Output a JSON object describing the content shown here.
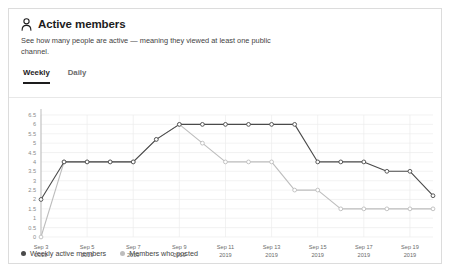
{
  "panel": {
    "icon": "person-icon",
    "title": "Active members",
    "description": "See how many people are active — meaning they viewed at least one public channel.",
    "tabs": [
      {
        "label": "Weekly",
        "active": true
      },
      {
        "label": "Daily",
        "active": false
      }
    ]
  },
  "colors": {
    "series_weekly_active": "#4a4a4a",
    "series_members_posted": "#bdbdbd",
    "grid": "#ededed",
    "axis_text": "#8a8a8a",
    "panel_border": "#dcdcdc",
    "tab_active": "#1d1c1d"
  },
  "chart_data": {
    "type": "line",
    "title": "",
    "xlabel": "",
    "ylabel": "",
    "ylim": [
      0,
      6.5
    ],
    "yticks": [
      "0",
      "0.5",
      "1",
      "1.5",
      "2",
      "2.5",
      "3",
      "3.5",
      "4",
      "4.5",
      "5",
      "5.5",
      "6",
      "6.5"
    ],
    "ytick_values": [
      0,
      0.5,
      1,
      1.5,
      2,
      2.5,
      3,
      3.5,
      4,
      4.5,
      5,
      5.5,
      6,
      6.5
    ],
    "grid": true,
    "legend_position": "bottom-left",
    "x": [
      "Sep 3 2019",
      "Sep 4 2019",
      "Sep 5 2019",
      "Sep 6 2019",
      "Sep 7 2019",
      "Sep 8 2019",
      "Sep 9 2019",
      "Sep 10 2019",
      "Sep 11 2019",
      "Sep 12 2019",
      "Sep 13 2019",
      "Sep 14 2019",
      "Sep 15 2019",
      "Sep 16 2019",
      "Sep 17 2019",
      "Sep 18 2019",
      "Sep 19 2019",
      "Sep 20 2019"
    ],
    "xtick_labels": [
      {
        "index": 0,
        "line1": "Sep 3",
        "line2": "2019"
      },
      {
        "index": 2,
        "line1": "Sep 5",
        "line2": "2019"
      },
      {
        "index": 4,
        "line1": "Sep 7",
        "line2": "2019"
      },
      {
        "index": 6,
        "line1": "Sep 9",
        "line2": "2019"
      },
      {
        "index": 8,
        "line1": "Sep 11",
        "line2": "2019"
      },
      {
        "index": 10,
        "line1": "Sep 13",
        "line2": "2019"
      },
      {
        "index": 12,
        "line1": "Sep 15",
        "line2": "2019"
      },
      {
        "index": 14,
        "line1": "Sep 17",
        "line2": "2019"
      },
      {
        "index": 16,
        "line1": "Sep 19",
        "line2": "2019"
      }
    ],
    "series": [
      {
        "name": "Weekly active members",
        "color": "#4a4a4a",
        "values": [
          2,
          4,
          4,
          4,
          4,
          5.2,
          6,
          6,
          6,
          6,
          6,
          6,
          4,
          4,
          4,
          3.5,
          3.5,
          2.2
        ]
      },
      {
        "name": "Members who posted",
        "color": "#bdbdbd",
        "values": [
          0,
          4,
          4,
          4,
          4,
          5.2,
          6,
          5,
          4,
          4,
          4,
          2.5,
          2.5,
          1.5,
          1.5,
          1.5,
          1.5,
          1.5
        ]
      }
    ]
  },
  "legend": [
    {
      "label": "Weekly active members",
      "color": "#4a4a4a"
    },
    {
      "label": "Members who posted",
      "color": "#bdbdbd"
    }
  ]
}
